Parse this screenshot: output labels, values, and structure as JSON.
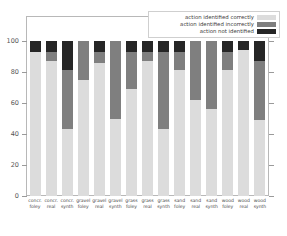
{
  "chart_data": {
    "type": "bar",
    "subtype": "stacked-bar-percent",
    "title": "",
    "xlabel": "",
    "ylabel": "",
    "ylim": [
      0,
      100
    ],
    "yticks": [
      0,
      20,
      40,
      60,
      80,
      100
    ],
    "ytick_labels": [
      "0",
      "20",
      "40",
      "60",
      "80",
      "100"
    ],
    "grid": false,
    "legend_position": "top-right",
    "categories": [
      "concr. foley",
      "concr. real",
      "concr. synth",
      "gravel foley",
      "gravel real",
      "gravel synth",
      "grass foley",
      "grass real",
      "grass synth",
      "sand foley",
      "sand real",
      "sand synth",
      "wood foley",
      "wood real",
      "wood synth"
    ],
    "category_lines": [
      [
        "concr.",
        "foley"
      ],
      [
        "concr.",
        "real"
      ],
      [
        "concr.",
        "synth"
      ],
      [
        "gravel",
        "foley"
      ],
      [
        "gravel",
        "real"
      ],
      [
        "gravel",
        "synth"
      ],
      [
        "grass",
        "foley"
      ],
      [
        "grass",
        "real"
      ],
      [
        "grass",
        "synth"
      ],
      [
        "sand",
        "foley"
      ],
      [
        "sand",
        "real"
      ],
      [
        "sand",
        "synth"
      ],
      [
        "wood",
        "foley"
      ],
      [
        "wood",
        "real"
      ],
      [
        "wood",
        "synth"
      ]
    ],
    "series": [
      {
        "name": "action identified correctly",
        "color": "#dcdcdc",
        "values": [
          93,
          87,
          43,
          75,
          86,
          50,
          69,
          87,
          43,
          81,
          62,
          56,
          81,
          94,
          49
        ]
      },
      {
        "name": "action identified incorrectly",
        "color": "#7f7f7f",
        "values": [
          0,
          6,
          38,
          25,
          7,
          50,
          24,
          6,
          50,
          12,
          38,
          44,
          12,
          0,
          38
        ]
      },
      {
        "name": "action not identified",
        "color": "#262626",
        "values": [
          7,
          7,
          19,
          0,
          7,
          0,
          7,
          7,
          7,
          7,
          0,
          0,
          7,
          6,
          13
        ]
      }
    ]
  },
  "legend": {
    "items": [
      {
        "label": "action identified correctly",
        "color": "#dcdcdc"
      },
      {
        "label": "action identified incorrectly",
        "color": "#7f7f7f"
      },
      {
        "label": "action not identified",
        "color": "#262626"
      }
    ]
  },
  "axes": {
    "y_tick_labels": [
      "100",
      "80",
      "60",
      "40",
      "20",
      "0"
    ]
  },
  "colors": {
    "frame": "#b8b8b8",
    "tick": "#9a9a9a",
    "text": "#4a4a4a",
    "background": "#ffffff"
  }
}
